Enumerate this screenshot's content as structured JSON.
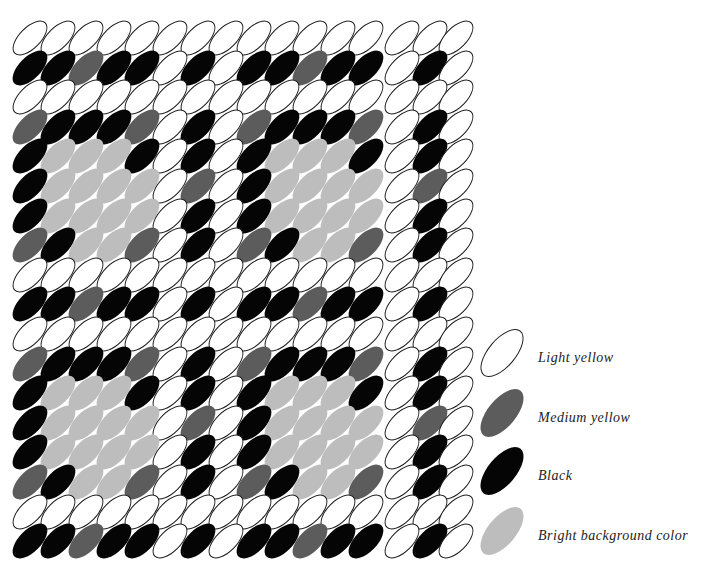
{
  "diagram": {
    "title": "",
    "palette": {
      "L": {
        "name": "Light yellow",
        "fill": "#ffffff",
        "outline": "#1a1a1a"
      },
      "M": {
        "name": "Medium yellow",
        "fill": "#5c5c5c"
      },
      "B": {
        "name": "Black",
        "fill": "#050505"
      },
      "P": {
        "name": "Bright background color",
        "fill": "#bdbdbd"
      }
    },
    "columns_x": [
      30,
      58,
      86,
      114,
      142,
      170,
      198,
      226,
      254,
      282,
      310,
      338,
      366,
      402,
      430,
      456
    ],
    "row_start_y": 38,
    "row_step": 29.6,
    "rows": [
      "LLLLLLLLLLLLLLLL",
      "BBMBBLBLBBMBBLBL",
      "LLLLLLLLLLLLLLLL",
      "MBBBMLBLMBBBMLBL",
      "BPPPBLBLBPPPBLBL",
      "BPPPPLMLBPPPPLML",
      "BPPPPLBLBPPPPLBL",
      "MBPPMLBLMBPPMLBL",
      "LLLLLLLLLLLLLLLL",
      "BBMBBLBLBBMBBLBL",
      "LLLLLLLLLLLLLLLL",
      "MBBBMLBLMBBBMLBL",
      "BPPPBLBLBPPPBLBL",
      "BPPPPLMLBPPPPLML",
      "BPPPPLBLBPPPPLBL",
      "MBPPMLBLMBPPMLBL",
      "LLLLLLLLLLLLLLLL",
      "BBMBBLBLBBMBBLBL"
    ]
  },
  "legend": {
    "items": [
      {
        "key": "L",
        "label": "Light yellow"
      },
      {
        "key": "M",
        "label": "Medium yellow"
      },
      {
        "key": "B",
        "label": "Black"
      },
      {
        "key": "P",
        "label": "Bright background color"
      }
    ]
  }
}
